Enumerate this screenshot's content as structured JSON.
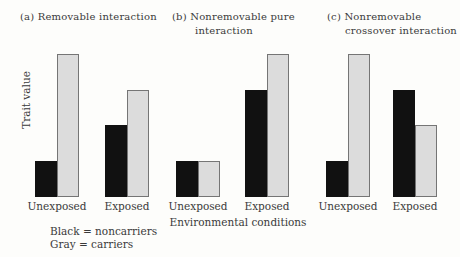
{
  "figure": {
    "ylabel": "Trait value",
    "xlabel": "Environmental conditions",
    "legend": {
      "line1": "Black = noncarriers",
      "line2": "Gray = carriers"
    },
    "colors": {
      "noncarriers_fill": "#111111",
      "carriers_fill": "#dcdcdc",
      "carriers_border": "#757575",
      "background": "#fdfdfb",
      "text": "#3a3a3a"
    }
  },
  "chart_data": [
    {
      "type": "bar",
      "panel": "a",
      "title_lines": [
        "(a) Removable interaction",
        ""
      ],
      "categories": [
        "Unexposed",
        "Exposed"
      ],
      "series": [
        {
          "name": "noncarriers",
          "color_key": "noncarriers_fill",
          "values": [
            2.5,
            5
          ]
        },
        {
          "name": "carriers",
          "color_key": "carriers_fill",
          "values": [
            10,
            7.5
          ]
        }
      ],
      "ylabel": "Trait value",
      "ylim": [
        0,
        10
      ],
      "grid": false,
      "legend_position": "below-left"
    },
    {
      "type": "bar",
      "panel": "b",
      "title_lines": [
        "(b) Nonremovable pure",
        "interaction"
      ],
      "categories": [
        "Unexposed",
        "Exposed"
      ],
      "series": [
        {
          "name": "noncarriers",
          "color_key": "noncarriers_fill",
          "values": [
            2.5,
            7.5
          ]
        },
        {
          "name": "carriers",
          "color_key": "carriers_fill",
          "values": [
            2.5,
            10
          ]
        }
      ],
      "ylim": [
        0,
        10
      ],
      "grid": false
    },
    {
      "type": "bar",
      "panel": "c",
      "title_lines": [
        "(c) Nonremovable",
        "crossover interaction"
      ],
      "categories": [
        "Unexposed",
        "Exposed"
      ],
      "series": [
        {
          "name": "noncarriers",
          "color_key": "noncarriers_fill",
          "values": [
            2.5,
            7.5
          ]
        },
        {
          "name": "carriers",
          "color_key": "carriers_fill",
          "values": [
            10,
            5
          ]
        }
      ],
      "ylim": [
        0,
        10
      ],
      "grid": false
    }
  ]
}
